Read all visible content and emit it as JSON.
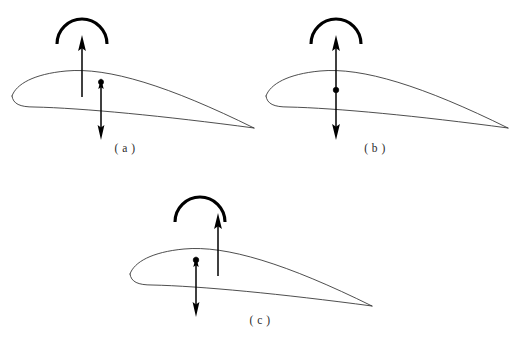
{
  "figure": {
    "background_color": "#ffffff",
    "line_color": "#2e2e2e",
    "arrow_color": "#000000",
    "width": 518,
    "height": 348,
    "panel_count": 3
  },
  "panels": [
    {
      "id": "a",
      "caption": "( a )",
      "label": "a",
      "elements": {
        "airfoil": "cambered-airfoil-outline",
        "moment_arc": "counter-clockwise-pitching-moment-arc",
        "lift_arrow": "upward-lift-arrow",
        "down_arrow": "downward-force-arrow",
        "point_marker": "aerodynamic-center-dot"
      },
      "arrangement": "lift arrow left of center dot; dot with short up-head and long down arrow at right"
    },
    {
      "id": "b",
      "caption": "( b )",
      "label": "b",
      "elements": {
        "airfoil": "cambered-airfoil-outline",
        "moment_arc": "counter-clockwise-pitching-moment-arc",
        "lift_arrow": "upward-lift-arrow",
        "down_arrow": "downward-force-arrow",
        "point_marker": "aerodynamic-center-dot"
      },
      "arrangement": "single continuous vertical line through the center dot; up arrow above, down arrow below"
    },
    {
      "id": "c",
      "caption": "( c )",
      "label": "c",
      "elements": {
        "airfoil": "cambered-airfoil-outline",
        "moment_arc": "counter-clockwise-pitching-moment-arc",
        "lift_arrow": "upward-lift-arrow",
        "down_arrow": "downward-force-arrow",
        "point_marker": "aerodynamic-center-dot"
      },
      "arrangement": "dot with downward arrow at left; separate upward lift arrow to the right"
    }
  ],
  "geometry": {
    "airfoil_upper_path": "M 8 62 C 12 50, 30 40, 62 37 C 104 33, 165 52, 250 94",
    "airfoil_lower_path": "M 8 62 C 9 70, 16 73, 30 73 C 78 74, 160 82, 250 94",
    "airfoil_chord_note": "rounded leading edge at left, sharp trailing edge at right",
    "arc_radius": 24,
    "arc_stroke_width": 3.1,
    "shaft_stroke_width": 1.5
  }
}
